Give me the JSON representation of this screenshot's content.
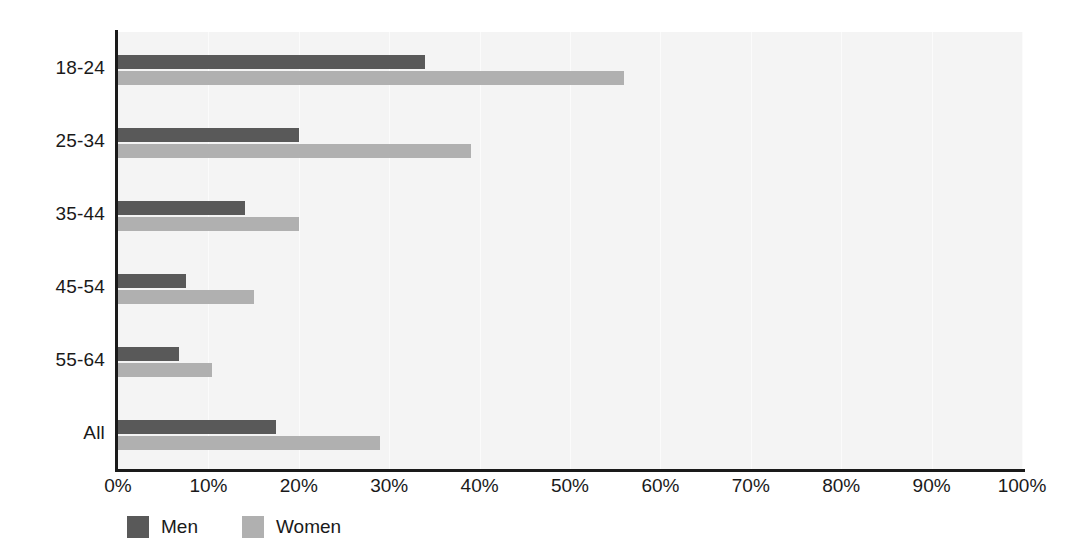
{
  "chart_data": {
    "type": "bar",
    "orientation": "horizontal",
    "title": "",
    "xlabel": "",
    "ylabel": "",
    "categories": [
      "18-24",
      "25-34",
      "35-44",
      "45-54",
      "55-64",
      "All"
    ],
    "series": [
      {
        "name": "Men",
        "color": "#595959",
        "values": [
          34,
          20,
          14,
          7.5,
          6.8,
          17.5
        ]
      },
      {
        "name": "Women",
        "color": "#b0b0b0",
        "values": [
          56,
          39,
          20,
          15,
          10.4,
          29
        ]
      }
    ],
    "xlim": [
      0,
      100
    ],
    "xticks": [
      0,
      10,
      20,
      30,
      40,
      50,
      60,
      70,
      80,
      90,
      100
    ],
    "xtick_labels": [
      "0%",
      "10%",
      "20%",
      "30%",
      "40%",
      "50%",
      "60%",
      "70%",
      "80%",
      "90%",
      "100%"
    ],
    "grid": true,
    "legend_position": "bottom-left",
    "plot_background": "#f4f4f4",
    "axis_color": "#1a1a1a"
  }
}
